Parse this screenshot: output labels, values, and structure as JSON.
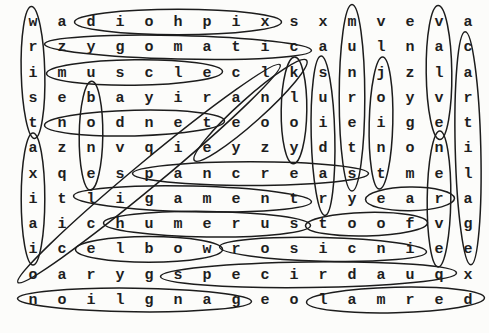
{
  "puzzle": {
    "type": "word_search",
    "rows": 12,
    "cols": 16,
    "grid": [
      "wadiohpixsxmveva",
      "rzygomaticaulnac",
      "imuscleclksnjzla",
      "sebayiranluroyvr",
      "tnodneteooieiget",
      "aznvqieyzydtnoni",
      "xqespancreastmel",
      "itligamentryeara",
      "aichumerustoofvg",
      "icelbowrosicniee",
      "oarygspecirdauqx",
      "noilgnageolamred"
    ],
    "circled_words": [
      {
        "answer": "wrist",
        "grid_text": "wrist",
        "direction": "down",
        "start": {
          "row": 1,
          "col": 1
        },
        "end": {
          "row": 5,
          "col": 1
        }
      },
      {
        "answer": "xiphoid",
        "grid_text": "diohpix",
        "direction": "left-reversed",
        "start": {
          "row": 1,
          "col": 3
        },
        "end": {
          "row": 1,
          "col": 9
        }
      },
      {
        "answer": "zygomatic",
        "grid_text": "zygomatic",
        "direction": "right",
        "start": {
          "row": 2,
          "col": 2
        },
        "end": {
          "row": 2,
          "col": 10
        }
      },
      {
        "answer": "muscle",
        "grid_text": "muscle",
        "direction": "right",
        "start": {
          "row": 3,
          "col": 2
        },
        "end": {
          "row": 3,
          "col": 7
        }
      },
      {
        "answer": "bone",
        "grid_text": "bone",
        "direction": "down",
        "start": {
          "row": 4,
          "col": 3
        },
        "end": {
          "row": 7,
          "col": 3
        }
      },
      {
        "answer": "tendon",
        "grid_text": "nodnet",
        "direction": "left-reversed",
        "start": {
          "row": 5,
          "col": 2
        },
        "end": {
          "row": 5,
          "col": 7
        }
      },
      {
        "answer": "axial",
        "grid_text": "axiai",
        "direction": "down",
        "start": {
          "row": 6,
          "col": 1
        },
        "end": {
          "row": 10,
          "col": 1
        }
      },
      {
        "answer": "occipital",
        "grid_text": "occipital",
        "direction": "diag-up-right",
        "start": {
          "row": 11,
          "col": 1
        },
        "end": {
          "row": 3,
          "col": 9
        }
      },
      {
        "answer": "knee",
        "grid_text": "knee",
        "direction": "diag-down-left",
        "start": {
          "row": 3,
          "col": 10
        },
        "end": {
          "row": 6,
          "col": 7
        }
      },
      {
        "answer": "yolk",
        "grid_text": "kloy",
        "direction": "up-reversed",
        "start": {
          "row": 3,
          "col": 10
        },
        "end": {
          "row": 6,
          "col": 10
        }
      },
      {
        "answer": "radius",
        "grid_text": "suidar",
        "direction": "up-reversed",
        "start": {
          "row": 3,
          "col": 11
        },
        "end": {
          "row": 8,
          "col": 11
        }
      },
      {
        "answer": "sternum",
        "grid_text": "munrets",
        "direction": "up-reversed",
        "start": {
          "row": 1,
          "col": 12
        },
        "end": {
          "row": 7,
          "col": 12
        }
      },
      {
        "answer": "joint",
        "grid_text": "joint",
        "direction": "down",
        "start": {
          "row": 3,
          "col": 13
        },
        "end": {
          "row": 7,
          "col": 13
        }
      },
      {
        "answer": "valve",
        "grid_text": "valve",
        "direction": "down",
        "start": {
          "row": 1,
          "col": 15
        },
        "end": {
          "row": 5,
          "col": 15
        }
      },
      {
        "answer": "nerve",
        "grid_text": "nerve",
        "direction": "down",
        "start": {
          "row": 6,
          "col": 15
        },
        "end": {
          "row": 10,
          "col": 15
        }
      },
      {
        "answer": "cartilage",
        "grid_text": "cartilage",
        "direction": "down",
        "start": {
          "row": 2,
          "col": 16
        },
        "end": {
          "row": 10,
          "col": 16
        }
      },
      {
        "answer": "pancreas",
        "grid_text": "pancreas",
        "direction": "right",
        "start": {
          "row": 7,
          "col": 5
        },
        "end": {
          "row": 7,
          "col": 12
        }
      },
      {
        "answer": "ligament",
        "grid_text": "ligament",
        "direction": "right",
        "start": {
          "row": 8,
          "col": 3
        },
        "end": {
          "row": 8,
          "col": 10
        }
      },
      {
        "answer": "ear",
        "grid_text": "ear",
        "direction": "right",
        "start": {
          "row": 8,
          "col": 13
        },
        "end": {
          "row": 8,
          "col": 15
        }
      },
      {
        "answer": "humerus",
        "grid_text": "humerus",
        "direction": "right",
        "start": {
          "row": 9,
          "col": 4
        },
        "end": {
          "row": 9,
          "col": 10
        }
      },
      {
        "answer": "foot",
        "grid_text": "toof",
        "direction": "left-reversed",
        "start": {
          "row": 9,
          "col": 11
        },
        "end": {
          "row": 9,
          "col": 14
        }
      },
      {
        "answer": "elbow",
        "grid_text": "elbow",
        "direction": "right",
        "start": {
          "row": 10,
          "col": 3
        },
        "end": {
          "row": 10,
          "col": 7
        }
      },
      {
        "answer": "incisor",
        "grid_text": "rosicni",
        "direction": "left-reversed",
        "start": {
          "row": 10,
          "col": 8
        },
        "end": {
          "row": 10,
          "col": 14
        }
      },
      {
        "answer": "quadriceps",
        "grid_text": "specirdauq",
        "direction": "left-reversed",
        "start": {
          "row": 11,
          "col": 6
        },
        "end": {
          "row": 11,
          "col": 15
        }
      },
      {
        "answer": "ganglion",
        "grid_text": "noilgnag",
        "direction": "left-reversed",
        "start": {
          "row": 12,
          "col": 1
        },
        "end": {
          "row": 12,
          "col": 8
        }
      },
      {
        "answer": "dermal",
        "grid_text": "lamred",
        "direction": "left-reversed",
        "start": {
          "row": 12,
          "col": 11
        },
        "end": {
          "row": 12,
          "col": 16
        }
      }
    ]
  },
  "style": {
    "ink": "#1e1e1e",
    "circle_ink": "#1c1c1c",
    "paper": "#fcfcfa"
  }
}
